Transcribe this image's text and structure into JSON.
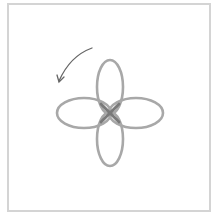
{
  "diagram": {
    "frame": {
      "stroke_color": "#d4d4d4"
    },
    "rose": {
      "center": [
        110,
        113
      ],
      "petals": [
        {
          "name": "top",
          "cx": 110,
          "cy": 87,
          "rx": 13,
          "ry": 27
        },
        {
          "name": "bottom",
          "cx": 110,
          "cy": 139,
          "rx": 13,
          "ry": 27
        },
        {
          "name": "left",
          "cx": 84,
          "cy": 113,
          "rx": 27,
          "ry": 15
        },
        {
          "name": "right",
          "cx": 136,
          "cy": 113,
          "rx": 27,
          "ry": 15
        }
      ],
      "stroke_color": "#a8a8a8",
      "center_color": "#777777"
    },
    "arrow": {
      "direction": "counter-clockwise",
      "color": "#666666"
    }
  }
}
